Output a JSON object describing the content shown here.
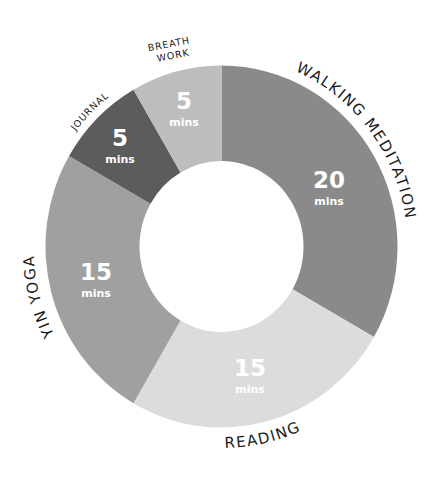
{
  "chart_data": {
    "type": "pie",
    "subtype": "donut",
    "title": "",
    "unit": "mins",
    "total": 60,
    "start_angle_deg": 0,
    "direction": "clockwise",
    "categories": [
      "Walking Meditation",
      "Reading",
      "Yin Yoga",
      "Journal",
      "Breath Work"
    ],
    "values": [
      20,
      15,
      15,
      5,
      5
    ],
    "slices": [
      {
        "label": "WALKING MEDITATION",
        "value": 20,
        "value_text": "20",
        "unit_text": "mins",
        "color": "#8a8a8a"
      },
      {
        "label": "READING",
        "value": 15,
        "value_text": "15",
        "unit_text": "mins",
        "color": "#dcdcdc"
      },
      {
        "label": "YIN YOGA",
        "value": 15,
        "value_text": "15",
        "unit_text": "mins",
        "color": "#a0a0a0"
      },
      {
        "label": "JOURNAL",
        "value": 5,
        "value_text": "5",
        "unit_text": "mins",
        "color": "#5c5c5c"
      },
      {
        "label_lines": [
          "BREATH",
          "WORK"
        ],
        "label": "BREATH WORK",
        "value": 5,
        "value_text": "5",
        "unit_text": "mins",
        "color": "#bdbdbd"
      }
    ],
    "legend": "none (labels placed along outer arc)",
    "value_label_color": "#ffffff",
    "category_label_color": "#1a1a1a"
  }
}
